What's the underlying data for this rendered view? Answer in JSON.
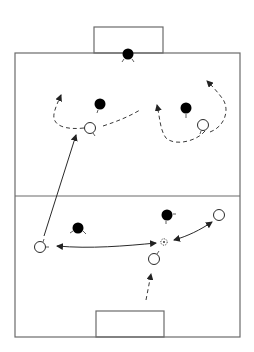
{
  "diagram": {
    "type": "soccer-drill",
    "colors": {
      "background": "#ffffff",
      "pitch_lines": "#6b6b6b",
      "defender": "#000000",
      "attacker": "#ffffff",
      "arrows": "#2a2a2a"
    },
    "pitch": {
      "left": 15,
      "top": 53,
      "right": 240,
      "bottom": 337,
      "halfway_y": 196
    },
    "goals": [
      {
        "name": "top-goal",
        "x": 94,
        "y": 27,
        "width": 69,
        "height": 26
      },
      {
        "name": "bottom-goal",
        "x": 96,
        "y": 311,
        "width": 68,
        "height": 26
      }
    ],
    "defenders": [
      {
        "name": "goalkeeper",
        "x": 128,
        "y": 54
      },
      {
        "name": "defender-top-left",
        "x": 100,
        "y": 104
      },
      {
        "name": "defender-top-right",
        "x": 186,
        "y": 108
      },
      {
        "name": "defender-bottom-left",
        "x": 78,
        "y": 228
      },
      {
        "name": "defender-bottom-right",
        "x": 167,
        "y": 215
      }
    ],
    "attackers": [
      {
        "name": "attacker-top-left",
        "x": 90,
        "y": 128
      },
      {
        "name": "attacker-top-right",
        "x": 203,
        "y": 125
      },
      {
        "name": "attacker-bottom-left",
        "x": 40,
        "y": 247
      },
      {
        "name": "attacker-bottom-right",
        "x": 219,
        "y": 215
      },
      {
        "name": "attacker-bottom-center",
        "x": 154,
        "y": 259
      }
    ],
    "ball": {
      "x": 164,
      "y": 242
    },
    "movements": [
      {
        "name": "pass-long-to-top-left",
        "kind": "pass",
        "from": [
          40,
          240
        ],
        "to": [
          76,
          134
        ]
      },
      {
        "name": "pass-exchange-left",
        "kind": "pass-two-way",
        "from": [
          56,
          246
        ],
        "to": [
          156,
          243
        ]
      },
      {
        "name": "pass-exchange-right",
        "kind": "pass-two-way",
        "from": [
          174,
          240
        ],
        "to": [
          212,
          222
        ]
      },
      {
        "name": "run-from-bottom-goal",
        "kind": "run",
        "from": [
          146,
          300
        ],
        "to": [
          151,
          272
        ]
      },
      {
        "name": "run-top-left-curve",
        "kind": "run"
      },
      {
        "name": "run-top-diagonal",
        "kind": "run"
      },
      {
        "name": "run-top-right-loop",
        "kind": "run"
      }
    ]
  }
}
